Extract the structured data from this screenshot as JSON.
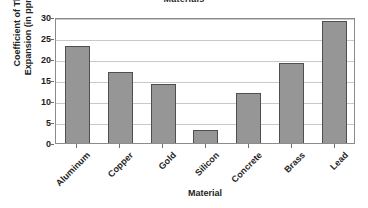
{
  "chart_data": {
    "type": "bar",
    "title": "Materials",
    "xlabel": "Material",
    "ylabel": "Coefficient of Thermal Expansion (in ppm per °C)",
    "ylabel_line1": "Coefficient of Thermal",
    "ylabel_line2": "Expansion (in ppm per °C)",
    "categories": [
      "Aluminum",
      "Copper",
      "Gold",
      "Silicon",
      "Concrete",
      "Brass",
      "Lead"
    ],
    "values": [
      23,
      17,
      14,
      3,
      12,
      19,
      29
    ],
    "ylim": [
      0,
      30
    ],
    "yticks": [
      0,
      5,
      10,
      15,
      20,
      25,
      30
    ],
    "ytick_labels": [
      "0",
      "5",
      "10",
      "15",
      "20",
      "25",
      "30"
    ],
    "grid": "horizontal",
    "legend": "none",
    "bar_color": "#969696",
    "bar_border_color": "#4f4f4f",
    "gridline_color": "#c9c9c9",
    "axis_color": "#8b8b8b",
    "background_color": "#ffffff"
  }
}
